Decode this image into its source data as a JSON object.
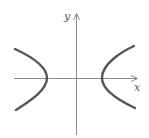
{
  "diagram": {
    "type": "hyperbola-sketch",
    "axes": {
      "x_label": "x",
      "y_label": "y",
      "axis_color": "#8a8a8a"
    },
    "curve": {
      "color": "#555555",
      "branches": [
        "left",
        "right"
      ]
    }
  }
}
